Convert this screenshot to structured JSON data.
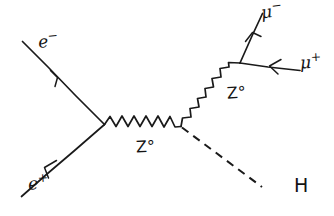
{
  "diagram": {
    "type": "feynman-diagram",
    "ink_color": "#1a1a1a",
    "background_color": "#ffffff",
    "labels": {
      "electron": "e",
      "electron_charge": "−",
      "positron": "e",
      "positron_charge": "+",
      "z_boson_1": "Z°",
      "z_boson_2": "Z°",
      "muon_minus": "μ",
      "muon_minus_charge": "−",
      "muon_plus": "μ",
      "muon_plus_charge": "+",
      "higgs": "H"
    },
    "vertices": [
      {
        "name": "e-e+-z-vertex",
        "x": 104,
        "y": 124
      },
      {
        "name": "z-z-h-vertex",
        "x": 181,
        "y": 126
      },
      {
        "name": "z-mumu-vertex",
        "x": 240,
        "y": 63
      }
    ],
    "lines": [
      {
        "name": "electron-incoming-line",
        "particle": "e−",
        "style": "solid-fermion",
        "from": [
          22,
          42
        ],
        "to": [
          104,
          124
        ],
        "arrow_direction": "toward-vertex"
      },
      {
        "name": "positron-outgoing-line",
        "particle": "e+",
        "style": "solid-fermion",
        "from": [
          104,
          124
        ],
        "to": [
          22,
          196
        ],
        "arrow_direction": "away-from-vertex"
      },
      {
        "name": "z-propagator-horizontal",
        "particle": "Z°",
        "style": "wavy-boson",
        "from": [
          104,
          124
        ],
        "to": [
          181,
          126
        ]
      },
      {
        "name": "z-propagator-diagonal",
        "particle": "Z°",
        "style": "wavy-boson",
        "from": [
          181,
          126
        ],
        "to": [
          240,
          63
        ]
      },
      {
        "name": "higgs-dashed-line",
        "particle": "H",
        "style": "dashed-scalar",
        "from": [
          181,
          126
        ],
        "to": [
          262,
          186
        ]
      },
      {
        "name": "muon-minus-line",
        "particle": "μ−",
        "style": "solid-fermion",
        "from": [
          240,
          63
        ],
        "to": [
          262,
          14
        ],
        "arrow_direction": "away-from-vertex"
      },
      {
        "name": "muon-plus-line",
        "particle": "μ+",
        "style": "solid-fermion",
        "from": [
          240,
          63
        ],
        "to": [
          300,
          70
        ],
        "arrow_direction": "toward-vertex"
      }
    ]
  }
}
